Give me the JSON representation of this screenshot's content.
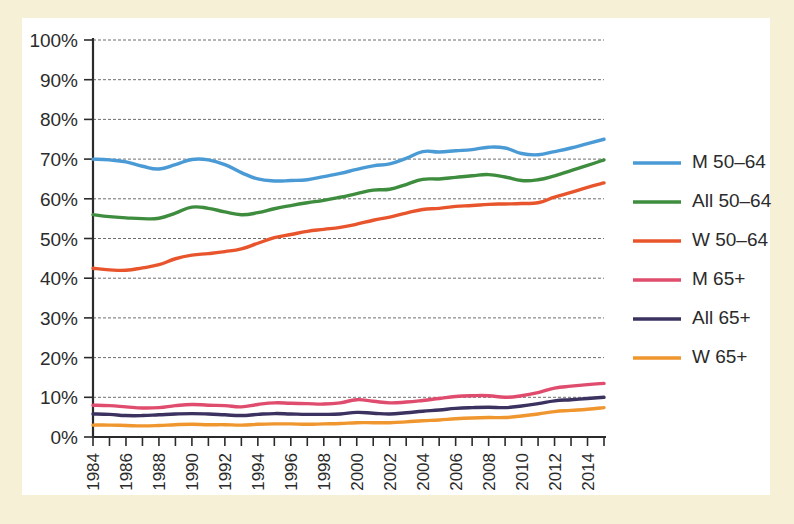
{
  "chart_data": {
    "type": "line",
    "title": "",
    "subtitle": "",
    "xlabel": "",
    "ylabel": "",
    "xlim": [
      1984,
      2015
    ],
    "ylim": [
      0,
      100
    ],
    "grid": true,
    "legend_position": "right",
    "x": [
      1984,
      1985,
      1986,
      1987,
      1988,
      1989,
      1990,
      1991,
      1992,
      1993,
      1994,
      1995,
      1996,
      1997,
      1998,
      1999,
      2000,
      2001,
      2002,
      2003,
      2004,
      2005,
      2006,
      2007,
      2008,
      2009,
      2010,
      2011,
      2012,
      2013,
      2014,
      2015
    ],
    "x_tick_labels": [
      "1984",
      "1986",
      "1988",
      "1990",
      "1992",
      "1994",
      "1996",
      "1998",
      "2000",
      "2002",
      "2004",
      "2006",
      "2008",
      "2010",
      "2012",
      "2014"
    ],
    "y_tick_labels": [
      "0%",
      "10%",
      "20%",
      "30%",
      "40%",
      "50%",
      "60%",
      "70%",
      "80%",
      "90%",
      "100%"
    ],
    "y_ticks": [
      0,
      10,
      20,
      30,
      40,
      50,
      60,
      70,
      80,
      90,
      100
    ],
    "series": [
      {
        "name": "M 50–64",
        "color": "#4a9bd5",
        "values": [
          70.0,
          69.8,
          69.3,
          68.2,
          67.5,
          68.6,
          69.9,
          69.8,
          68.6,
          66.6,
          65.0,
          64.5,
          64.6,
          64.8,
          65.6,
          66.4,
          67.4,
          68.3,
          68.8,
          70.2,
          71.9,
          71.8,
          72.1,
          72.4,
          73.0,
          72.8,
          71.4,
          71.1,
          71.9,
          72.8,
          73.9,
          75.0
        ]
      },
      {
        "name": "All 50–64",
        "color": "#3e8c3e",
        "values": [
          56.0,
          55.5,
          55.2,
          55.0,
          55.1,
          56.4,
          57.9,
          57.6,
          56.7,
          56.0,
          56.5,
          57.5,
          58.3,
          59.0,
          59.6,
          60.4,
          61.3,
          62.2,
          62.4,
          63.6,
          64.9,
          65.0,
          65.4,
          65.8,
          66.1,
          65.5,
          64.6,
          64.8,
          65.8,
          67.1,
          68.4,
          69.8
        ]
      },
      {
        "name": "W 50–64",
        "color": "#e8552d",
        "values": [
          42.5,
          42.1,
          42.0,
          42.6,
          43.4,
          44.9,
          45.8,
          46.2,
          46.7,
          47.4,
          48.8,
          50.2,
          51.0,
          51.8,
          52.3,
          52.8,
          53.6,
          54.6,
          55.4,
          56.4,
          57.3,
          57.6,
          58.1,
          58.3,
          58.6,
          58.7,
          58.8,
          59.0,
          60.4,
          61.6,
          62.9,
          64.0
        ]
      },
      {
        "name": "M 65+",
        "color": "#e04c6e",
        "values": [
          8.0,
          7.9,
          7.6,
          7.3,
          7.4,
          7.9,
          8.2,
          8.0,
          7.9,
          7.6,
          8.2,
          8.6,
          8.5,
          8.4,
          8.3,
          8.6,
          9.4,
          9.0,
          8.6,
          8.8,
          9.2,
          9.7,
          10.2,
          10.4,
          10.4,
          10.0,
          10.4,
          11.2,
          12.3,
          12.8,
          13.2,
          13.5
        ]
      },
      {
        "name": "All 65+",
        "color": "#3b3260",
        "values": [
          5.8,
          5.7,
          5.4,
          5.4,
          5.6,
          5.8,
          5.9,
          5.8,
          5.6,
          5.4,
          5.7,
          5.9,
          5.8,
          5.7,
          5.7,
          5.8,
          6.2,
          6.0,
          5.8,
          6.1,
          6.5,
          6.8,
          7.2,
          7.4,
          7.5,
          7.4,
          7.8,
          8.4,
          9.1,
          9.4,
          9.7,
          10.0
        ]
      },
      {
        "name": "W 65+",
        "color": "#f0962e",
        "values": [
          3.0,
          3.0,
          2.9,
          2.8,
          2.9,
          3.1,
          3.2,
          3.1,
          3.1,
          3.0,
          3.2,
          3.3,
          3.3,
          3.2,
          3.3,
          3.4,
          3.6,
          3.6,
          3.6,
          3.8,
          4.1,
          4.3,
          4.6,
          4.8,
          4.9,
          4.9,
          5.3,
          5.8,
          6.4,
          6.7,
          7.0,
          7.4
        ]
      }
    ]
  },
  "legend": {
    "entries": [
      {
        "label": "M 50–64",
        "color": "#4a9bd5"
      },
      {
        "label": "All 50–64",
        "color": "#3e8c3e"
      },
      {
        "label": "W 50–64",
        "color": "#e8552d"
      },
      {
        "label": "M 65+",
        "color": "#e04c6e"
      },
      {
        "label": "All 65+",
        "color": "#3b3260"
      },
      {
        "label": "W 65+",
        "color": "#f0962e"
      }
    ]
  },
  "colors": {
    "page_background": "#f6f0d6",
    "plot_background": "#ffffff",
    "gridline": "#6d6d6d",
    "axis": "#2b2b2b",
    "text": "#2b2b2b"
  }
}
